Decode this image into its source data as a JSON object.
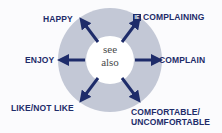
{
  "center": {
    "line1": "see",
    "line2": "also"
  },
  "links": [
    {
      "label": "HAPPY"
    },
    {
      "label": "COMPLAINING",
      "badge": "IE"
    },
    {
      "label": "COMPLAIN"
    },
    {
      "label": "COMFORTABLE/",
      "label2": "UNCOMFORTABLE"
    },
    {
      "label": "LIKE/NOT LIKE"
    },
    {
      "label": "ENJOY"
    }
  ],
  "colors": {
    "arrow": "#1e2c6a",
    "ring": "#c3c8d6",
    "hub": "#ffffff"
  }
}
